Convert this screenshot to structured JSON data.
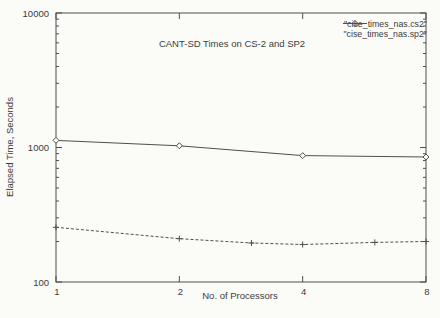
{
  "figure": {
    "title": "CANT-SD Times on CS-2 and SP2",
    "xlabel": "No. of Processors",
    "ylabel": "Elapsed Time, Seconds"
  },
  "legend": {
    "entries": [
      {
        "label": "\"cise_times_nas.cs2\"",
        "marker": "diamond",
        "line_style": "solid"
      },
      {
        "label": "\"cise_times_nas.sp2\"",
        "marker": "plus",
        "line_style": "dashed"
      }
    ],
    "position": "top-right"
  },
  "colors": {
    "axis": "#4f4f4f",
    "series": "#4f4f4f",
    "text": "#3c3c3c",
    "background": "#fbfbf8"
  },
  "chart_data": {
    "type": "line",
    "title": "CANT-SD Times on CS-2 and SP2",
    "xlabel": "No. of Processors",
    "ylabel": "Elapsed Time, Seconds",
    "x_scale": "log2",
    "y_scale": "log10",
    "xlim": [
      1,
      8
    ],
    "ylim": [
      100,
      10000
    ],
    "x_ticks": [
      1,
      2,
      4,
      8
    ],
    "y_ticks": [
      100,
      1000,
      10000
    ],
    "grid": false,
    "legend_position": "top-right",
    "series": [
      {
        "name": "\"cise_times_nas.cs2\"",
        "marker": "diamond",
        "line_style": "solid",
        "x": [
          1,
          2,
          4,
          8
        ],
        "values": [
          1130,
          1030,
          870,
          850
        ]
      },
      {
        "name": "\"cise_times_nas.sp2\"",
        "marker": "plus",
        "line_style": "dashed",
        "x": [
          1,
          2,
          3,
          4,
          6,
          8
        ],
        "values": [
          255,
          210,
          195,
          190,
          197,
          200
        ]
      }
    ]
  }
}
